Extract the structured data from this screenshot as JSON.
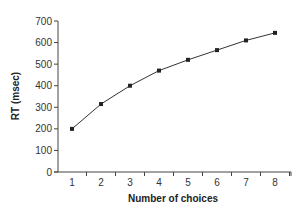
{
  "chart_data": {
    "type": "line",
    "title": "",
    "xlabel": "Number of choices",
    "ylabel": "RT (msec)",
    "categories": [
      "1",
      "2",
      "3",
      "4",
      "5",
      "6",
      "7",
      "8"
    ],
    "x": [
      1,
      2,
      3,
      4,
      5,
      6,
      7,
      8
    ],
    "series": [
      {
        "name": "RT",
        "values": [
          200,
          315,
          400,
          470,
          520,
          565,
          610,
          645
        ],
        "marker": "square",
        "color": "#222222"
      }
    ],
    "ylim": [
      0,
      700
    ],
    "yticks": [
      0,
      100,
      200,
      300,
      400,
      500,
      600,
      700
    ],
    "xticks": [
      1,
      2,
      3,
      4,
      5,
      6,
      7,
      8
    ],
    "grid": false,
    "legend": "none"
  }
}
